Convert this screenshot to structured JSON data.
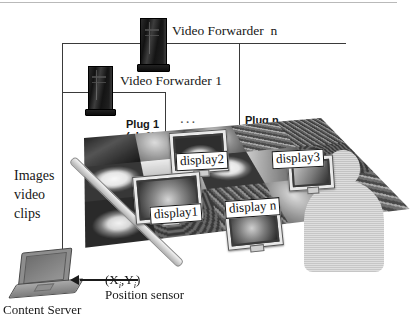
{
  "figure": {
    "type": "system-architecture-diagram"
  },
  "nodes": {
    "video_forwarder_n": "Video Forwarder  n",
    "video_forwarder_1": "Video Forwarder 1",
    "content_server": "Content Server",
    "position_sensor": "Position sensor"
  },
  "labels": {
    "plug_1": "Plug 1",
    "plug_1_channel": "(ch 1)",
    "plug_n": "Plug n",
    "plug_n_channel": "(ch n)",
    "ellipsis": "...",
    "images_line1": "Images",
    "images_line2": "video",
    "images_line3": "clips",
    "coordinates": "(X",
    "coordinates_sub1": "i",
    "coordinates_mid": ",Y",
    "coordinates_sub2": "i",
    "coordinates_end": ")"
  },
  "displays": [
    {
      "id": "display1",
      "label": "display1"
    },
    {
      "id": "display2",
      "label": "display2"
    },
    {
      "id": "display3",
      "label": "display3"
    },
    {
      "id": "displayn",
      "label": "display n"
    }
  ],
  "colors": {
    "ink": "#171717",
    "wire": "#3a3a3a",
    "tag_bg": "#ffffff",
    "tag_border": "#171717",
    "device_dark": "#121212",
    "mat_light": "#cfcfcf",
    "person_fill": "#cfcfcf"
  }
}
